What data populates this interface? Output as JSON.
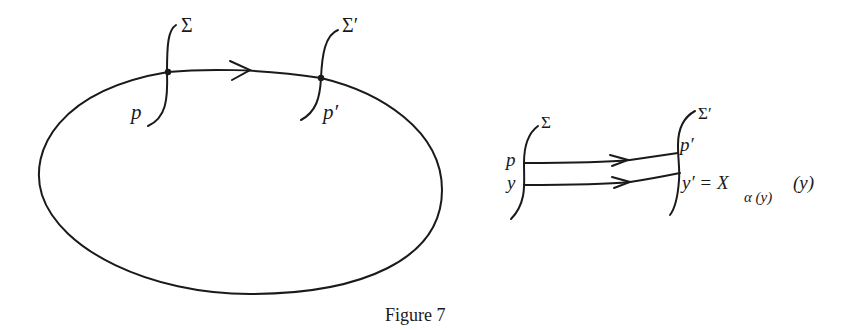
{
  "figure": {
    "caption": "Figure 7",
    "colors": {
      "ink": "#1a1a1a",
      "background": "#ffffff"
    }
  },
  "left_diagram": {
    "description": "Closed periodic orbit with two transversal sections",
    "section_1": {
      "label": "Σ",
      "point_label": "p"
    },
    "section_2": {
      "label": "Σ′",
      "point_label": "p′"
    }
  },
  "right_diagram": {
    "description": "Poincaré map between local sections",
    "section_1": {
      "label": "Σ",
      "point_labels": [
        "p",
        "y"
      ]
    },
    "section_2": {
      "label": "Σ′",
      "point_labels": [
        "p′"
      ]
    },
    "formula": {
      "lhs": "y′ = X",
      "subscript": "α (y)",
      "argument": "(y)"
    }
  }
}
